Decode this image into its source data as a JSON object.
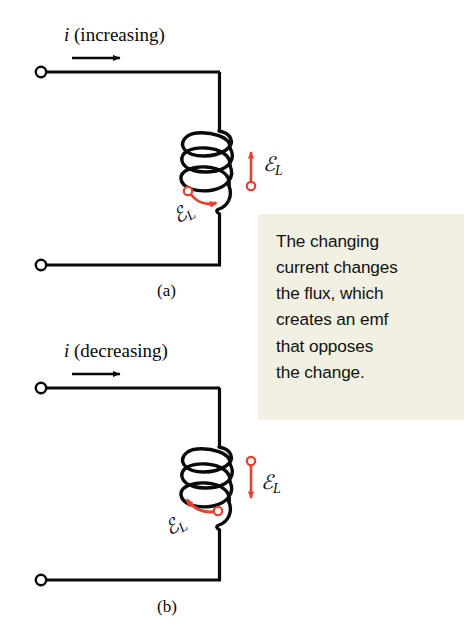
{
  "figure": {
    "background": "#ffffff",
    "wire_color": "#0a0a0a",
    "emf_color": "#e8402a",
    "callout_bg": "#f1f0e2"
  },
  "callout": {
    "lines": [
      "The changing",
      "current changes",
      "the flux, which",
      "creates an emf",
      "that opposes",
      "the change."
    ],
    "text": "The changing current changes the flux, which creates an emf that opposes the change."
  },
  "panels": [
    {
      "id": "a",
      "label": "(a)",
      "current_symbol": "i",
      "current_text": " (increasing)",
      "current_full": "i (increasing)",
      "current_direction": "right",
      "emf_straight_arrow_direction": "up",
      "emf_curved_arrow_direction": "right",
      "emf_label_right": {
        "symbol": "ℰ",
        "subscript": "L"
      },
      "emf_label_left": {
        "symbol": "ℰ",
        "subscript": "L"
      },
      "coil_turns": 3
    },
    {
      "id": "b",
      "label": "(b)",
      "current_symbol": "i",
      "current_text": " (decreasing)",
      "current_full": "i (decreasing)",
      "current_direction": "right",
      "emf_straight_arrow_direction": "down",
      "emf_curved_arrow_direction": "left",
      "emf_label_right": {
        "symbol": "ℰ",
        "subscript": "L"
      },
      "emf_label_left": {
        "symbol": "ℰ",
        "subscript": "L"
      },
      "coil_turns": 3
    }
  ],
  "icons": {
    "terminal": "open-circle-terminal",
    "current_arrow": "arrow-right-icon",
    "emf_arrow_up": "arrow-up-icon",
    "emf_arrow_down": "arrow-down-icon",
    "emf_arrow_curved": "curved-arrow-icon",
    "coil": "inductor-coil-icon"
  }
}
